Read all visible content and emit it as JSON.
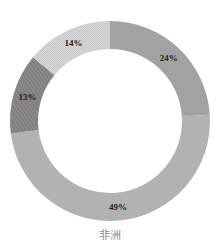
{
  "chart_data": {
    "type": "pie",
    "variant": "donut",
    "title": "非洲",
    "categories": [
      "A",
      "B",
      "C",
      "D"
    ],
    "values": [
      24,
      49,
      13,
      14
    ],
    "labels": [
      "24%",
      "49%",
      "13%",
      "14%"
    ],
    "colors": [
      "#a2a2a2",
      "#b2b2b2",
      "#8c8c8c",
      "#d6d6d6"
    ],
    "start_angle_deg_from_top": 0,
    "direction": "clockwise",
    "legend": "none",
    "geometry": {
      "cx": 110,
      "cy": 121,
      "outer_r": 100,
      "inner_r": 72
    }
  },
  "caption": "非洲"
}
